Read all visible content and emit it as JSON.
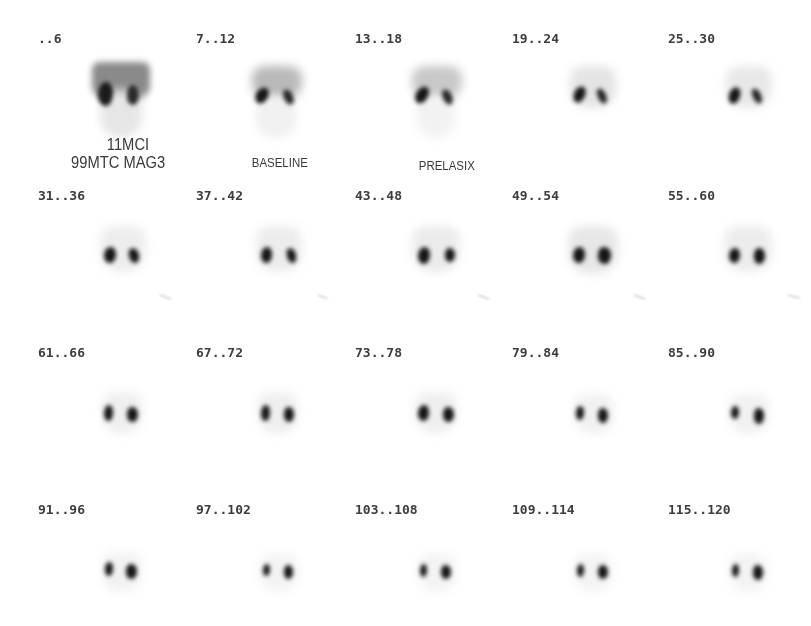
{
  "viewer": {
    "study": "99MTC MAG3 renal scintigraphy",
    "layout": {
      "columns": 5,
      "rows": 4
    }
  },
  "frames": [
    {
      "label": "..6"
    },
    {
      "label": "7..12"
    },
    {
      "label": "13..18"
    },
    {
      "label": "19..24"
    },
    {
      "label": "25..30"
    },
    {
      "label": "31..36"
    },
    {
      "label": "37..42"
    },
    {
      "label": "43..48"
    },
    {
      "label": "49..54"
    },
    {
      "label": "55..60"
    },
    {
      "label": "61..66"
    },
    {
      "label": "67..72"
    },
    {
      "label": "73..78"
    },
    {
      "label": "79..84"
    },
    {
      "label": "85..90"
    },
    {
      "label": "91..96"
    },
    {
      "label": "97..102"
    },
    {
      "label": "103..108"
    },
    {
      "label": "109..114"
    },
    {
      "label": "115..120"
    }
  ],
  "annotations": {
    "dose_line1": "11MCI",
    "dose_line2": "99MTC MAG3",
    "baseline": "BASELINE",
    "prelasix": "PRELASIX"
  },
  "colors": {
    "background": "#ffffff",
    "label_text": "#3d3d3d",
    "tracer_uptake": "#151515"
  }
}
